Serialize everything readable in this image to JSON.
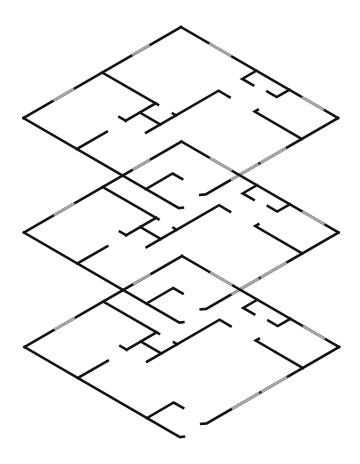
{
  "diagram": {
    "type": "isometric-floor-plan-stack",
    "canvas": {
      "width": 360,
      "height": 464,
      "background": "#ffffff"
    },
    "colors": {
      "wall": "#141414",
      "window": "#a8a8a8"
    },
    "projection": {
      "u_axis": [
        -157.5,
        91
      ],
      "v_axis": [
        157,
        91
      ]
    },
    "floors": [
      {
        "name": "floor-1-top",
        "origin": [
          181,
          27
        ]
      },
      {
        "name": "floor-2-middle",
        "origin": [
          181.5,
          141.5
        ]
      },
      {
        "name": "floor-3-bottom",
        "origin": [
          182,
          256
        ]
      }
    ],
    "walls": [
      {
        "name": "outer-top-left-wall",
        "points": [
          [
            0,
            0
          ],
          [
            1,
            0
          ]
        ]
      },
      {
        "name": "outer-top-right-wall",
        "points": [
          [
            0,
            0
          ],
          [
            0,
            1
          ]
        ]
      },
      {
        "name": "outer-front-right-wall",
        "points": [
          [
            0,
            1
          ],
          [
            0.84,
            1
          ],
          [
            0.86,
            0.985
          ]
        ]
      },
      {
        "name": "outer-front-left-wall",
        "points": [
          [
            1,
            0
          ],
          [
            1,
            0.99
          ],
          [
            0.985,
            1.0
          ]
        ]
      },
      {
        "name": "left-room-partition",
        "points": [
          [
            0.5,
            0
          ],
          [
            0.5,
            0.355
          ]
        ]
      },
      {
        "name": "hall-stub-wall",
        "points": [
          [
            0.5,
            0.34
          ],
          [
            0.69,
            0.34
          ]
        ]
      },
      {
        "name": "hall-stub-tick",
        "points": [
          [
            0.6,
            0.34
          ],
          [
            0.6,
            0.47
          ]
        ]
      },
      {
        "name": "hall-stub-end",
        "points": [
          [
            0.69,
            0.3
          ],
          [
            0.69,
            0.34
          ]
        ]
      },
      {
        "name": "central-long-wall",
        "points": [
          [
            0.69,
            0.47
          ],
          [
            0.23,
            0.47
          ],
          [
            0.23,
            0.54
          ]
        ]
      },
      {
        "name": "central-wall-tick",
        "points": [
          [
            0.5,
            0.45
          ],
          [
            0.5,
            0.47
          ]
        ]
      },
      {
        "name": "closet-bracket-1",
        "points": [
          [
            0,
            0.48
          ],
          [
            0.09,
            0.48
          ],
          [
            0.09,
            0.55
          ]
        ]
      },
      {
        "name": "closet-bracket-2",
        "points": [
          [
            0,
            0.69
          ],
          [
            0.08,
            0.69
          ],
          [
            0.08,
            0.63
          ]
        ]
      },
      {
        "name": "right-room-partition",
        "points": [
          [
            0.21,
            0.7
          ],
          [
            0.23,
            0.7
          ],
          [
            0.23,
            1
          ]
        ]
      },
      {
        "name": "front-left-partition",
        "points": [
          [
            1,
            0.34
          ],
          [
            0.81,
            0.34
          ]
        ]
      },
      {
        "name": "entry-bracket",
        "points": [
          [
            1,
            0.78
          ],
          [
            0.83,
            0.78
          ],
          [
            0.83,
            0.84
          ]
        ]
      }
    ],
    "windows": [
      {
        "name": "window-top-left-1",
        "points": [
          [
            0.2,
            0
          ],
          [
            0.31,
            0
          ]
        ]
      },
      {
        "name": "window-top-left-2",
        "points": [
          [
            0.68,
            0
          ],
          [
            0.81,
            0
          ]
        ]
      },
      {
        "name": "window-top-right-1",
        "points": [
          [
            0,
            0.18
          ],
          [
            0,
            0.32
          ]
        ]
      },
      {
        "name": "window-top-right-2",
        "points": [
          [
            0,
            0.77
          ],
          [
            0,
            0.91
          ]
        ]
      },
      {
        "name": "window-front-right",
        "points": [
          [
            0.33,
            1
          ],
          [
            0.68,
            1
          ]
        ],
        "mullion": [
          0.5,
          1
        ]
      }
    ]
  }
}
